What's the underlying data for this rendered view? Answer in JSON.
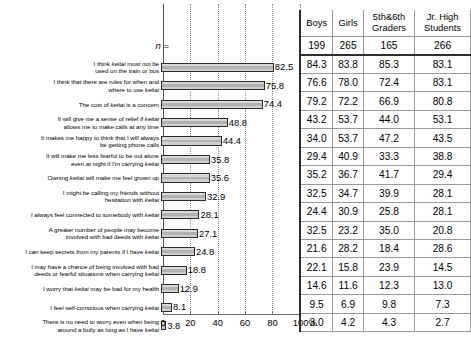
{
  "axis": {
    "ticks": [
      {
        "value": 0,
        "label": "0"
      },
      {
        "value": 20,
        "label": "20"
      },
      {
        "value": 40,
        "label": "40"
      },
      {
        "value": 60,
        "label": "60"
      },
      {
        "value": 80,
        "label": "80"
      },
      {
        "value": 100,
        "label": "100"
      }
    ],
    "unit_suffix": "%",
    "last_label": "100%",
    "min": 0,
    "max": 100
  },
  "n_row": {
    "label_italic": "n",
    "label_eq": " =",
    "values": [
      "199",
      "265",
      "165",
      "266"
    ]
  },
  "table": {
    "columns": [
      {
        "line1": "Boys",
        "line2": ""
      },
      {
        "line1": "Girls",
        "line2": ""
      },
      {
        "line1": "5th&6th",
        "line2": "Graders"
      },
      {
        "line1": "Jr. High",
        "line2": "Students"
      }
    ]
  },
  "chart_data": {
    "type": "bar",
    "title": "",
    "xlabel": "",
    "ylabel": "",
    "xlim": [
      0,
      100
    ],
    "grid": true,
    "orientation": "horizontal",
    "categories": [
      "I think keitai must not be used on the train or bus",
      "I think that there are rules for when and where to use keitai",
      "The cost of keitai is a concern",
      "It will give me a sense of relief if keitai allows me to make calls at any time",
      "It makes me happy to think that I will always be getting phone calls",
      "It will make me less fearful to be out alone even at night if  I'm carrying keitai",
      "Owning keitai will make me feel grown up",
      "I might be calling my friends without hesitation with keitai",
      "I always feel connected to somebody with keitai",
      "A greater number of people may become involved with bad deeds with keitai",
      "I can keep secrets from my parents if I have keitai",
      "I may have a chance of being involved with bad deeds or fearful situations when carrying keitai",
      "I worry that keitai may be bad for my health",
      "I feel self-conscious when carrying keitai",
      "There is no need to worry even when being around a bully as long as I have keitai"
    ],
    "categories_html": [
      "I think <i>keitai</i> must not be<br>used on the train or bus",
      "I think that there are rules for when and<br>where to use <i>keitai</i>",
      "The cost of <i>keitai</i> is a concern",
      "It will give me a sense of relief if <i>keitai</i><br>allows me to make calls at any time",
      "It makes me happy to think that I will always<br>be getting phone calls",
      "It will make me less fearful to be out alone<br>even at night if  I'm carrying <i>keitai</i>",
      "Owning <i>keitai</i> will make me feel grown up",
      "I might be calling my friends without<br>hesitation with <i>keitai</i>",
      "I always feel connected to somebody with <i>keitai</i>",
      "A greater number of people may become<br>involved with bad deeds with <i>keitai</i>",
      "I can keep secrets from my parents if I have <i>keitai</i>",
      "I may have a chance of being involved with bad<br>deeds or fearful situations when carrying <i>keitai</i>",
      "I worry that <i>keitai</i> may be bad for my health",
      "I feel self-conscious when carrying <i>keitai</i>",
      "There is no need to worry even when being<br>around a bully as long as I have <i>keitai</i>"
    ],
    "values": [
      82.5,
      75.8,
      74.4,
      48.8,
      44.4,
      35.8,
      35.6,
      32.9,
      28.1,
      27.1,
      24.8,
      18.8,
      12.9,
      8.1,
      3.8
    ],
    "value_labels": [
      "82.5",
      "75.8",
      "74.4",
      "48.8",
      "44.4",
      "35.8",
      "35.6",
      "32.9",
      "28.1",
      "27.1",
      "24.8",
      "18.8",
      "12.9",
      "8.1",
      "3.8"
    ],
    "series": [
      {
        "name": "Boys",
        "values": [
          84.3,
          76.6,
          79.2,
          43.2,
          34.0,
          29.4,
          35.2,
          32.5,
          24.4,
          32.5,
          21.6,
          22.1,
          14.6,
          9.5,
          3.0
        ]
      },
      {
        "name": "Girls",
        "values": [
          83.8,
          78.0,
          72.2,
          53.7,
          53.7,
          40.9,
          36.7,
          34.7,
          30.9,
          23.2,
          28.2,
          15.8,
          11.6,
          6.9,
          4.2
        ]
      },
      {
        "name": "5th&6th Graders",
        "values": [
          85.3,
          72.4,
          66.9,
          44.0,
          47.2,
          33.3,
          41.7,
          39.9,
          25.8,
          35.0,
          18.4,
          23.9,
          12.3,
          9.8,
          4.3
        ]
      },
      {
        "name": "Jr. High Students",
        "values": [
          83.1,
          83.1,
          80.8,
          53.1,
          43.5,
          38.8,
          29.4,
          28.1,
          28.1,
          20.8,
          28.6,
          14.5,
          13.0,
          7.3,
          2.7
        ]
      }
    ],
    "series_labels": [
      [
        "84.3",
        "83.8",
        "85.3",
        "83.1"
      ],
      [
        "76.6",
        "78.0",
        "72.4",
        "83.1"
      ],
      [
        "79.2",
        "72.2",
        "66.9",
        "80.8"
      ],
      [
        "43.2",
        "53.7",
        "44.0",
        "53.1"
      ],
      [
        "34.0",
        "53.7",
        "47.2",
        "43.5"
      ],
      [
        "29.4",
        "40.9",
        "33.3",
        "38.8"
      ],
      [
        "35.2",
        "36.7",
        "41.7",
        "29.4"
      ],
      [
        "32.5",
        "34.7",
        "39.9",
        "28.1"
      ],
      [
        "24.4",
        "30.9",
        "25.8",
        "28.1"
      ],
      [
        "32.5",
        "23.2",
        "35.0",
        "20.8"
      ],
      [
        "21.6",
        "28.2",
        "18.4",
        "28.6"
      ],
      [
        "22.1",
        "15.8",
        "23.9",
        "14.5"
      ],
      [
        "14.6",
        "11.6",
        "12.3",
        "13.0"
      ],
      [
        "9.5",
        "6.9",
        "9.8",
        "7.3"
      ],
      [
        "3.0",
        "4.2",
        "4.3",
        "2.7"
      ]
    ]
  }
}
